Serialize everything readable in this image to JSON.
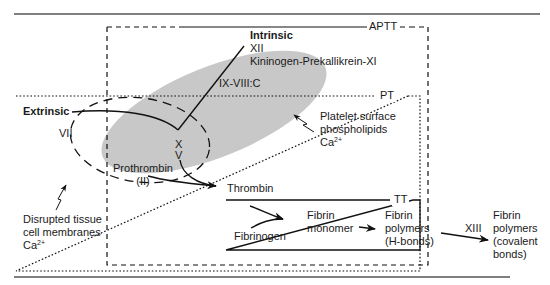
{
  "diagram": {
    "boxes": {
      "aptt": "APTT",
      "pt": "PT",
      "tt": "TT"
    },
    "pathways": {
      "intrinsic": {
        "title": "Intrinsic",
        "factor_1": "XII",
        "factor_2": "Kininogen-Prekallikrein-XI"
      },
      "extrinsic": {
        "title": "Extrinsic",
        "factor": "VII"
      }
    },
    "complex": "IX-VIII:C",
    "common": {
      "factor_x": "X",
      "factor_v": "V",
      "prothrombin_1": "Prothrombin",
      "prothrombin_2": "(II)",
      "thrombin": "Thrombin"
    },
    "annotations": {
      "platelet_1": "Platelet surface",
      "platelet_2": "phospholipids",
      "platelet_ca": "Ca",
      "platelet_ca_sup": "2+",
      "tissue_1": "Disrupted tissue",
      "tissue_2": "cell membranes",
      "tissue_ca": "Ca",
      "tissue_ca_sup": "2+"
    },
    "fibrin": {
      "fibrinogen": "Fibrinogen",
      "monomer_1": "Fibrin",
      "monomer_2": "monomer",
      "hbond_1": "Fibrin",
      "hbond_2": "polymers",
      "hbond_3": "(H-bonds)",
      "factor_xiii": "XIII",
      "covalent_1": "Fibrin",
      "covalent_2": "polymers",
      "covalent_3": "(covalent",
      "covalent_4": "bonds)"
    },
    "colors": {
      "platelet_fill": "#c8c8c8",
      "line": "#111111",
      "rule": "#555555"
    }
  }
}
